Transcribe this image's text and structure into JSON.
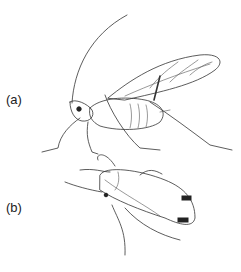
{
  "figure": {
    "panels": [
      {
        "id": "a",
        "label": "(a)",
        "subject": "winged aphid (lateral view)"
      },
      {
        "id": "b",
        "label": "(b)",
        "subject": "wingless aphid (dorsal view)"
      }
    ]
  }
}
